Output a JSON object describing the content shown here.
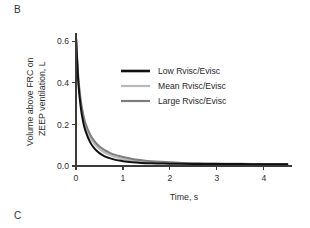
{
  "figure": {
    "panel_label_current": "B",
    "panel_label_next": "C"
  },
  "chart_data": {
    "type": "line",
    "title": "",
    "xlabel": "Time, s",
    "ylabel": "Volume above FRC on ZEEP ventilation, L",
    "ylabel_line1": "Volume above FRC on",
    "ylabel_line2": "ZEEP ventilation, L",
    "xlim": [
      0,
      4.6
    ],
    "ylim": [
      0,
      0.64
    ],
    "xticks": [
      0,
      1,
      2,
      3,
      4
    ],
    "xticklabels": [
      "0",
      "1",
      "2",
      "3",
      "4"
    ],
    "yticks": [
      0.0,
      0.2,
      0.4,
      0.6
    ],
    "yticklabels": [
      "0.0",
      "0.2",
      "0.4",
      "0.6"
    ],
    "grid": false,
    "legend_position": "upper-center-right",
    "x": [
      0,
      0.05,
      0.1,
      0.15,
      0.2,
      0.3,
      0.4,
      0.5,
      0.6,
      0.7,
      0.8,
      0.9,
      1.0,
      1.2,
      1.4,
      1.6,
      1.8,
      2.0,
      2.25,
      2.5,
      2.75,
      3.0,
      3.25,
      3.5,
      3.75,
      4.0,
      4.25,
      4.5
    ],
    "series": [
      {
        "name": "Low Rvisc/Evisc",
        "color": "#101010",
        "width": 2.0,
        "values": [
          0.62,
          0.4,
          0.285,
          0.215,
          0.17,
          0.115,
          0.082,
          0.062,
          0.048,
          0.039,
          0.032,
          0.027,
          0.023,
          0.018,
          0.015,
          0.013,
          0.012,
          0.011,
          0.0105,
          0.01,
          0.0098,
          0.0095,
          0.0093,
          0.0091,
          0.009,
          0.0089,
          0.0088,
          0.0087
        ]
      },
      {
        "name": "Mean Rvisc/Evisc",
        "color": "#b9b9b9",
        "width": 2.0,
        "values": [
          0.62,
          0.415,
          0.305,
          0.238,
          0.193,
          0.138,
          0.104,
          0.082,
          0.066,
          0.055,
          0.046,
          0.039,
          0.034,
          0.026,
          0.021,
          0.018,
          0.015,
          0.014,
          0.0125,
          0.0115,
          0.0108,
          0.0103,
          0.0099,
          0.0096,
          0.0094,
          0.0092,
          0.0091,
          0.009
        ]
      },
      {
        "name": "Large Rvisc/Evisc",
        "color": "#7d7d7d",
        "width": 2.0,
        "values": [
          0.62,
          0.425,
          0.318,
          0.252,
          0.207,
          0.152,
          0.117,
          0.094,
          0.078,
          0.066,
          0.056,
          0.049,
          0.043,
          0.034,
          0.028,
          0.023,
          0.02,
          0.018,
          0.015,
          0.0135,
          0.0123,
          0.0115,
          0.0108,
          0.0103,
          0.0099,
          0.0096,
          0.0094,
          0.0092
        ]
      }
    ],
    "legend": [
      {
        "label": "Low Rvisc/Evisc",
        "color": "#101010"
      },
      {
        "label": "Mean Rvisc/Evisc",
        "color": "#b9b9b9"
      },
      {
        "label": "Large Rvisc/Evisc",
        "color": "#7d7d7d"
      }
    ]
  }
}
